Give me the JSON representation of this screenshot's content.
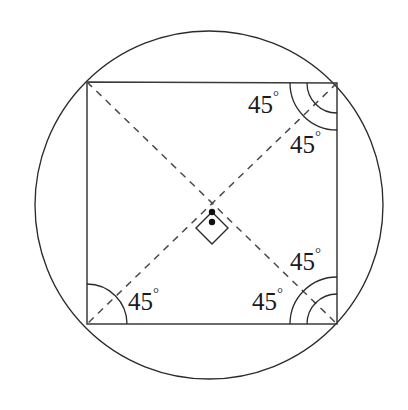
{
  "figure": {
    "background_color": "#ffffff",
    "line_color": "#2b2b2b",
    "dash_color": "#4a4a4a",
    "label_color": "#1a1a1a",
    "degree_symbol": "°"
  },
  "circle": {
    "name": "circumscribed-circle",
    "cx": 209,
    "cy": 205,
    "r": 174,
    "stroke": "#2b2b2b"
  },
  "square": {
    "name": "inscribed-square",
    "corners": [
      {
        "id": "top-left",
        "x": 87,
        "y": 82
      },
      {
        "id": "top-right",
        "x": 337,
        "y": 83
      },
      {
        "id": "bottom-right",
        "x": 337,
        "y": 324
      },
      {
        "id": "bottom-left",
        "x": 87,
        "y": 324
      }
    ],
    "stroke": "#3a3a3a"
  },
  "diagonals": [
    {
      "name": "diagonal-tl-br",
      "x1": 87,
      "y1": 82,
      "x2": 337,
      "y2": 324,
      "style": "dashed"
    },
    {
      "name": "diagonal-tr-bl",
      "x1": 337,
      "y1": 83,
      "x2": 87,
      "y2": 324,
      "style": "dashed"
    }
  ],
  "center": {
    "name": "diagonal-intersection",
    "x": 212,
    "y": 212,
    "dot_radius": 3.2,
    "right_angle_marker": {
      "shape": "rotated-square",
      "half_diagonal": 16,
      "inner_dot": {
        "x": 212,
        "y": 222,
        "r": 3.2
      }
    }
  },
  "angle_labels": [
    {
      "id": "angle-top-right-upper",
      "value": "45",
      "unit": "°",
      "x": 248,
      "y": 107,
      "vertex": "top-right"
    },
    {
      "id": "angle-top-right-lower",
      "value": "45",
      "unit": "°",
      "x": 290,
      "y": 147,
      "vertex": "top-right"
    },
    {
      "id": "angle-bottom-right-upper",
      "value": "45",
      "unit": "°",
      "x": 290,
      "y": 264,
      "vertex": "bottom-right"
    },
    {
      "id": "angle-bottom-right-lower",
      "value": "45",
      "unit": "°",
      "x": 252,
      "y": 304,
      "vertex": "bottom-right"
    },
    {
      "id": "angle-bottom-left",
      "value": "45",
      "unit": "°",
      "x": 128,
      "y": 304,
      "vertex": "bottom-left"
    }
  ],
  "angle_arcs": [
    {
      "id": "arc-top-right-outer",
      "vertex": "top-right",
      "radius": 47
    },
    {
      "id": "arc-top-right-inner",
      "vertex": "top-right",
      "radius": 30
    },
    {
      "id": "arc-bottom-right-outer",
      "vertex": "bottom-right",
      "radius": 47
    },
    {
      "id": "arc-bottom-right-inner",
      "vertex": "bottom-right",
      "radius": 30
    },
    {
      "id": "arc-bottom-left",
      "vertex": "bottom-left",
      "radius": 40
    }
  ]
}
